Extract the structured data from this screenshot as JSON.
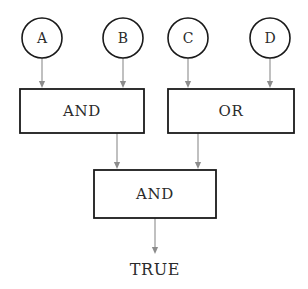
{
  "diagram": {
    "type": "logic-gate-tree",
    "canvas": {
      "width": 308,
      "height": 289,
      "background": "#ffffff"
    },
    "colors": {
      "shape_stroke": "#1a1a1a",
      "shape_fill": "#ffffff",
      "connector": "#8c8c8c",
      "text": "#2b2b2b"
    },
    "inputs": [
      {
        "id": "input-a",
        "label": "A",
        "cx": 42,
        "cy": 38,
        "r": 20
      },
      {
        "id": "input-b",
        "label": "B",
        "cx": 123,
        "cy": 38,
        "r": 20
      },
      {
        "id": "input-c",
        "label": "C",
        "cx": 188,
        "cy": 38,
        "r": 20
      },
      {
        "id": "input-d",
        "label": "D",
        "cx": 270,
        "cy": 38,
        "r": 20
      }
    ],
    "gates": [
      {
        "id": "gate-and-left",
        "label": "AND",
        "x": 20,
        "y": 89,
        "width": 124,
        "height": 44
      },
      {
        "id": "gate-or-right",
        "label": "OR",
        "x": 168,
        "y": 89,
        "width": 126,
        "height": 44
      },
      {
        "id": "gate-and-bottom",
        "label": "AND",
        "x": 94,
        "y": 170,
        "width": 122,
        "height": 48
      }
    ],
    "output": {
      "id": "output-result",
      "label": "TRUE",
      "x": 155,
      "y": 270
    },
    "connectors": [
      {
        "id": "conn-a-to-and",
        "from": "input-a",
        "to": "gate-and-left",
        "x1": 42,
        "y1": 58,
        "x2": 42,
        "y2": 88
      },
      {
        "id": "conn-b-to-and",
        "from": "input-b",
        "to": "gate-and-left",
        "x1": 123,
        "y1": 58,
        "x2": 123,
        "y2": 88
      },
      {
        "id": "conn-c-to-or",
        "from": "input-c",
        "to": "gate-or-right",
        "x1": 188,
        "y1": 58,
        "x2": 188,
        "y2": 88
      },
      {
        "id": "conn-d-to-or",
        "from": "input-d",
        "to": "gate-or-right",
        "x1": 270,
        "y1": 58,
        "x2": 270,
        "y2": 88
      },
      {
        "id": "conn-and-to-and",
        "from": "gate-and-left",
        "to": "gate-and-bottom",
        "x1": 117,
        "y1": 133,
        "x2": 117,
        "y2": 169
      },
      {
        "id": "conn-or-to-and",
        "from": "gate-or-right",
        "to": "gate-and-bottom",
        "x1": 198,
        "y1": 133,
        "x2": 198,
        "y2": 169
      },
      {
        "id": "conn-and-to-output",
        "from": "gate-and-bottom",
        "to": "output-result",
        "x1": 155,
        "y1": 218,
        "x2": 155,
        "y2": 254
      }
    ]
  }
}
